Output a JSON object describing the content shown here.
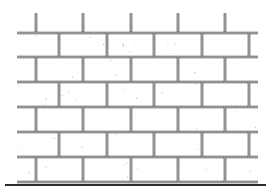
{
  "figure": {
    "title": "",
    "colors": {
      "background": "#ffffff",
      "mortar_line": "#4a4a4a",
      "mortar_inner": "#ffffff",
      "ground_line": "#2a2a2a",
      "speckle": "#8a8a8a"
    },
    "wall": {
      "left": 17,
      "right": 258,
      "top_stub_y": 13,
      "course_lines_y": [
        33,
        57,
        82,
        107,
        132,
        157,
        182
      ],
      "ground_y": 185,
      "ground_left": 5,
      "ground_right": 266,
      "top_stub_x": [
        36,
        83,
        131,
        178,
        225
      ],
      "odd_course_joints_x": [
        59,
        107,
        154,
        202,
        249
      ],
      "even_course_joints_x": [
        36,
        83,
        131,
        178,
        225
      ],
      "course_count": 6
    }
  }
}
